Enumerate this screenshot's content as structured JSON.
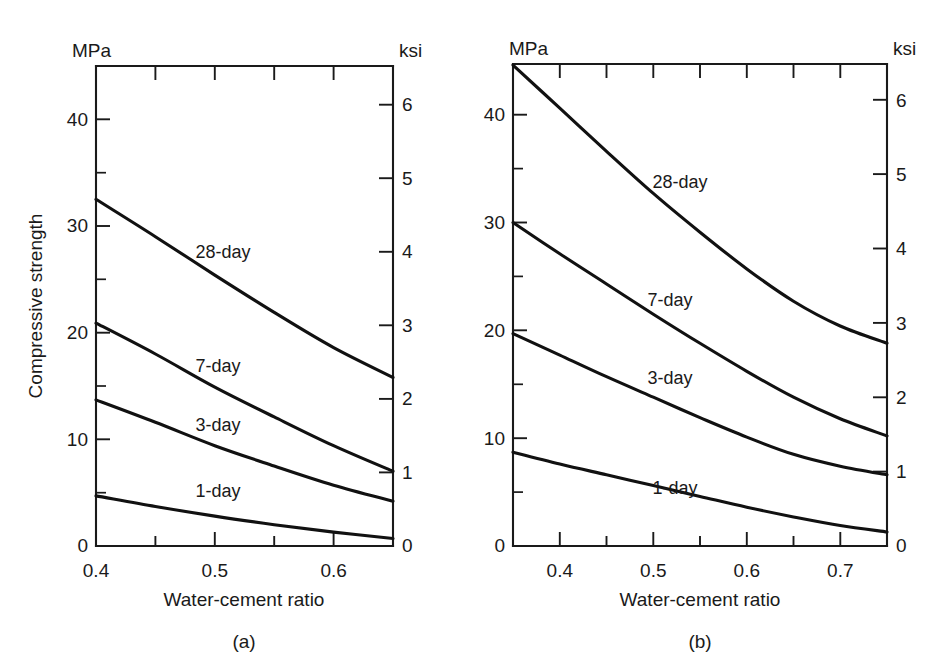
{
  "figure": {
    "background": "#ffffff",
    "ink_color": "#1a1a1a",
    "curve_color": "#111111"
  },
  "panel_a": {
    "caption": "(a)",
    "left_unit": "MPa",
    "right_unit": "ksi",
    "y_axis_title": "Compressive strength",
    "x_axis_title": "Water-cement ratio",
    "left_ticks": [
      "0",
      "10",
      "20",
      "30",
      "40"
    ],
    "right_ticks": [
      "0",
      "1",
      "2",
      "3",
      "4",
      "5",
      "6"
    ],
    "x_ticks": [
      "0.4",
      "0.5",
      "0.6"
    ],
    "series_labels": [
      "28-day",
      "7-day",
      "3-day",
      "1-day"
    ]
  },
  "panel_b": {
    "caption": "(b)",
    "left_unit": "MPa",
    "right_unit": "ksi",
    "y_axis_title": "Compressive strength",
    "x_axis_title": "Water-cement ratio",
    "left_ticks": [
      "0",
      "10",
      "20",
      "30",
      "40"
    ],
    "right_ticks": [
      "0",
      "1",
      "2",
      "3",
      "4",
      "5",
      "6"
    ],
    "x_ticks": [
      "0.4",
      "0.5",
      "0.6",
      "0.7"
    ],
    "series_labels": [
      "28-day",
      "7-day",
      "3-day",
      "1-day"
    ]
  },
  "chart_data": [
    {
      "type": "line",
      "panel": "(a)",
      "title": "",
      "xlabel": "Water-cement ratio",
      "ylabel": "Compressive strength",
      "y_unit_left": "MPa",
      "y_unit_right": "ksi",
      "xlim": [
        0.4,
        0.65
      ],
      "ylim": [
        0,
        45
      ],
      "ylim_right": [
        0,
        6.53
      ],
      "grid": false,
      "legend": "inline-curve-labels",
      "x_major_ticks": [
        0.4,
        0.45,
        0.5,
        0.55,
        0.6
      ],
      "x_tick_labels": [
        {
          "x": 0.4,
          "label": "0.4"
        },
        {
          "x": 0.5,
          "label": "0.5"
        },
        {
          "x": 0.6,
          "label": "0.6"
        }
      ],
      "y_major_ticks_left": [
        0,
        10,
        20,
        30,
        40
      ],
      "y_minor_ticks_left": [
        5,
        15,
        25,
        35
      ],
      "y_major_ticks_right": [
        0,
        1,
        2,
        3,
        4,
        5,
        6
      ],
      "x": [
        0.4,
        0.45,
        0.5,
        0.55,
        0.6,
        0.65
      ],
      "series": [
        {
          "name": "28-day",
          "unit": "MPa",
          "values": [
            32.5,
            29.0,
            25.4,
            21.9,
            18.6,
            15.8
          ],
          "values_ksi": [
            4.71,
            4.21,
            3.68,
            3.18,
            2.7,
            2.29
          ]
        },
        {
          "name": "7-day",
          "unit": "MPa",
          "values": [
            20.9,
            18.0,
            14.9,
            12.1,
            9.4,
            7.0
          ],
          "values_ksi": [
            3.03,
            2.61,
            2.16,
            1.75,
            1.36,
            1.02
          ]
        },
        {
          "name": "3-day",
          "unit": "MPa",
          "values": [
            13.7,
            11.6,
            9.4,
            7.5,
            5.7,
            4.2
          ],
          "values_ksi": [
            1.99,
            1.68,
            1.36,
            1.09,
            0.83,
            0.61
          ]
        },
        {
          "name": "1-day",
          "unit": "MPa",
          "values": [
            4.7,
            3.7,
            2.8,
            2.0,
            1.3,
            0.7
          ],
          "values_ksi": [
            0.68,
            0.54,
            0.41,
            0.29,
            0.19,
            0.1
          ]
        }
      ]
    },
    {
      "type": "line",
      "panel": "(b)",
      "title": "",
      "xlabel": "Water-cement ratio",
      "ylabel": "Compressive strength",
      "y_unit_left": "MPa",
      "y_unit_right": "ksi",
      "xlim": [
        0.35,
        0.75
      ],
      "ylim": [
        0,
        44.7
      ],
      "ylim_right": [
        0,
        6.48
      ],
      "grid": false,
      "legend": "inline-curve-labels",
      "x_major_ticks": [
        0.4,
        0.45,
        0.5,
        0.55,
        0.6,
        0.65,
        0.7
      ],
      "x_tick_labels": [
        {
          "x": 0.4,
          "label": "0.4"
        },
        {
          "x": 0.5,
          "label": "0.5"
        },
        {
          "x": 0.6,
          "label": "0.6"
        },
        {
          "x": 0.7,
          "label": "0.7"
        }
      ],
      "y_major_ticks_left": [
        0,
        10,
        20,
        30,
        40
      ],
      "y_minor_ticks_left": [
        5,
        15,
        25,
        35
      ],
      "y_major_ticks_right": [
        0,
        1,
        2,
        3,
        4,
        5,
        6
      ],
      "x": [
        0.35,
        0.4,
        0.45,
        0.5,
        0.55,
        0.6,
        0.65,
        0.7,
        0.75
      ],
      "series": [
        {
          "name": "28-day",
          "unit": "MPa",
          "values": [
            44.6,
            40.6,
            36.6,
            32.7,
            29.1,
            25.7,
            22.7,
            20.4,
            18.8
          ],
          "values_ksi": [
            6.47,
            5.89,
            5.31,
            4.74,
            4.22,
            3.73,
            3.29,
            2.96,
            2.73
          ]
        },
        {
          "name": "7-day",
          "unit": "MPa",
          "values": [
            30.0,
            27.1,
            24.3,
            21.5,
            18.8,
            16.2,
            13.8,
            11.8,
            10.2
          ],
          "values_ksi": [
            4.35,
            3.93,
            3.52,
            3.12,
            2.73,
            2.35,
            2.0,
            1.71,
            1.48
          ]
        },
        {
          "name": "3-day",
          "unit": "MPa",
          "values": [
            19.7,
            17.7,
            15.7,
            13.8,
            11.9,
            10.1,
            8.5,
            7.4,
            6.6
          ],
          "values_ksi": [
            2.86,
            2.57,
            2.28,
            2.0,
            1.73,
            1.46,
            1.23,
            1.07,
            0.96
          ]
        },
        {
          "name": "1-day",
          "unit": "MPa",
          "values": [
            8.7,
            7.6,
            6.6,
            5.6,
            4.6,
            3.6,
            2.7,
            1.9,
            1.3
          ],
          "values_ksi": [
            1.26,
            1.1,
            0.96,
            0.81,
            0.67,
            0.52,
            0.39,
            0.28,
            0.19
          ]
        }
      ]
    }
  ]
}
